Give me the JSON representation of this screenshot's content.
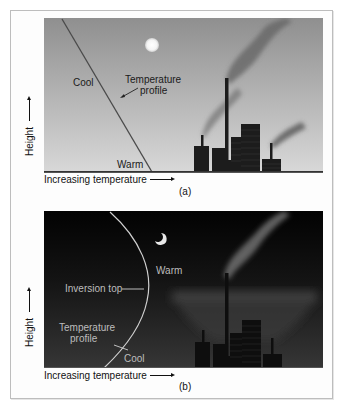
{
  "panel_a": {
    "label_cool": "Cool",
    "label_warm": "Warm",
    "label_profile_line1": "Temperature",
    "label_profile_line2": "profile",
    "x_axis": "Increasing temperature",
    "y_axis": "Height",
    "caption": "(a)",
    "sky_icon": "sun-icon",
    "colors": {
      "sky_top": "#8f8f8f",
      "sky_bottom": "#d8d8d8",
      "line": "#4a4a4a",
      "buildings": "#1c1c1c"
    }
  },
  "panel_b": {
    "label_warm": "Warm",
    "label_cool": "Cool",
    "label_inversion": "Inversion top",
    "label_profile_line1": "Temperature",
    "label_profile_line2": "profile",
    "x_axis": "Increasing temperature",
    "y_axis": "Height",
    "caption": "(b)",
    "sky_icon": "moon-icon",
    "colors": {
      "sky_top": "#020202",
      "sky_bottom": "#363636",
      "line": "#d0d0d0",
      "buildings": "#0e0e0e"
    }
  }
}
